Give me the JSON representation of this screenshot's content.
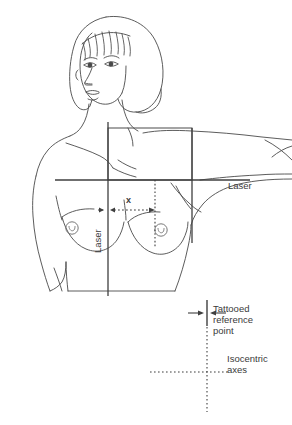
{
  "figure": {
    "colors": {
      "ink": "#3f3f3f",
      "line": "#555555",
      "background": "#ffffff",
      "text": "#3a3a3a"
    }
  },
  "labels": {
    "laser_right": "Laser",
    "laser_vertical": "Laser",
    "distance_x": "x",
    "tattooed_reference_point": "Tattooed\nreference\npoint",
    "isocentric_axes": "Isocentric\naxes"
  },
  "annotations": {
    "markers": [
      {
        "name": "nipple-marker-left",
        "cx": 72,
        "cy": 228
      },
      {
        "name": "nipple-marker-right",
        "cx": 161,
        "cy": 230
      }
    ],
    "lines": [
      {
        "name": "vertical-laser-line",
        "style": "solid",
        "x1": 108,
        "y1": 122,
        "x2": 108,
        "y2": 296
      },
      {
        "name": "horizontal-laser-line",
        "style": "solid",
        "x1": 55,
        "y1": 180,
        "x2": 250,
        "y2": 180
      },
      {
        "name": "field-vertical-line-right",
        "style": "solid",
        "x1": 192,
        "y1": 128,
        "x2": 192,
        "y2": 243
      },
      {
        "name": "midline-dotted-line",
        "style": "dotted",
        "x1": 155,
        "y1": 180,
        "x2": 155,
        "y2": 248
      },
      {
        "name": "isocentric-vertical-axis",
        "style": "dotted",
        "x1": 207,
        "y1": 327,
        "x2": 207,
        "y2": 412
      },
      {
        "name": "isocentric-horizontal-axis",
        "style": "dotted",
        "x1": 150,
        "y1": 372,
        "x2": 225,
        "y2": 372
      },
      {
        "name": "tattooed-reference-bar",
        "style": "solid",
        "x1": 207,
        "y1": 300,
        "x2": 207,
        "y2": 326
      }
    ],
    "measurement_arrow": {
      "name": "x-distance-arrow",
      "from_x": 108,
      "to_x": 155,
      "y": 210,
      "label": "x"
    }
  }
}
